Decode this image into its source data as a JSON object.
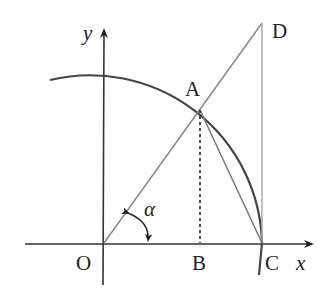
{
  "diagram": {
    "type": "unit-circle-trigonometry",
    "axes": {
      "x_label": "x",
      "y_label": "y"
    },
    "points": {
      "O": {
        "label": "O",
        "x": 104,
        "y": 243
      },
      "A": {
        "label": "A",
        "x": 200,
        "y": 110
      },
      "B": {
        "label": "B",
        "x": 200,
        "y": 243
      },
      "C": {
        "label": "C",
        "x": 262,
        "y": 243
      },
      "D": {
        "label": "D",
        "x": 262,
        "y": 23
      }
    },
    "angle_label": "α",
    "segments": [
      "OD",
      "AC",
      "CD",
      "AB (dashed)"
    ],
    "arc": "circular arc through A and C",
    "colors": {
      "stroke": "#333333",
      "light_stroke": "#888888",
      "text": "#222222"
    }
  }
}
